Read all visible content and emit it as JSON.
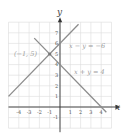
{
  "chart_data": {
    "type": "line",
    "title": "",
    "xlabel": "x",
    "ylabel": "y",
    "xlim": [
      -5,
      5
    ],
    "ylim": [
      -2,
      8
    ],
    "grid": true,
    "x_ticks": [
      "-4",
      "-3",
      "-2",
      "-1",
      "1",
      "2",
      "3",
      "4"
    ],
    "y_ticks": [
      "-1",
      "1",
      "2",
      "3",
      "4",
      "5",
      "6",
      "7"
    ],
    "series": [
      {
        "name": "x - y = -6",
        "equation": "y = x + 6",
        "points": [
          [
            -5,
            1
          ],
          [
            1.8,
            7.8
          ]
        ]
      },
      {
        "name": "x + y = 4",
        "equation": "y = -x + 4",
        "points": [
          [
            -2.5,
            6.5
          ],
          [
            4.5,
            -0.5
          ]
        ]
      }
    ],
    "annotations": [
      {
        "text": "(-1, 5)",
        "x": -1,
        "y": 5,
        "type": "intersection-point"
      },
      {
        "text": "x - y = -6",
        "label_for": "line-1"
      },
      {
        "text": "x + y = 4",
        "label_for": "line-2"
      }
    ]
  },
  "labels": {
    "intersection": "(−1, 5)",
    "line1": "x − y = −6",
    "line2": "x + y = 4",
    "x_axis": "x",
    "y_axis": "y"
  }
}
